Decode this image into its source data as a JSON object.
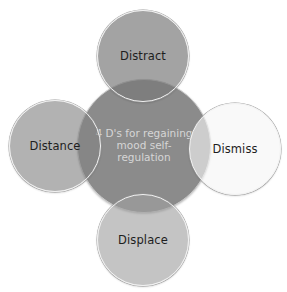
{
  "diagram": {
    "type": "radial-venn",
    "center": {
      "lines": [
        "4 D's for regaining",
        "mood self-",
        "regulation"
      ],
      "fill": "#8b8b8b",
      "text_color": "#d6d6d6"
    },
    "nodes": [
      {
        "position": "top",
        "label": "Distract",
        "fill": "#a2a2a2"
      },
      {
        "position": "left",
        "label": "Distance",
        "fill": "#a8a8a8"
      },
      {
        "position": "right",
        "label": "Dismiss",
        "fill": "#f5f5f5"
      },
      {
        "position": "bottom",
        "label": "Displace",
        "fill": "#b6b6b6"
      }
    ],
    "label_color": "#1e1e1e",
    "border_color": "#f2f2f2"
  }
}
